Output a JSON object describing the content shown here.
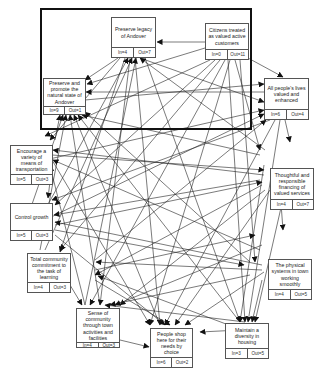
{
  "diagram": {
    "type": "interrelationship-digraph",
    "highlight_frame": "thick rectangle enclosing top drivers",
    "nodes": [
      {
        "id": "legacy",
        "label": "Preserve legacy of Andover",
        "in": "In=4",
        "out": "Out=7"
      },
      {
        "id": "citizens",
        "label": "Citizens treated as valued active customers",
        "in": "In=0",
        "out": "Out=11"
      },
      {
        "id": "natural",
        "label": "Preserve and promote the natural state of Andover",
        "in": "In=9",
        "out": "Out=1"
      },
      {
        "id": "people",
        "label": "All people's lives valued and enhanced",
        "in": "In=6",
        "out": "Out=4"
      },
      {
        "id": "transport",
        "label": "Encourage a variety of means of transportation",
        "in": "In=5",
        "out": "Out=3"
      },
      {
        "id": "financing",
        "label": "Thoughtful and responsible financing of valued services",
        "in": "In=4",
        "out": "Out=7"
      },
      {
        "id": "growth",
        "label": "Control growth",
        "in": "In=5",
        "out": "Out=3"
      },
      {
        "id": "learning",
        "label": "Total community commitment to the task of learning",
        "in": "In=4",
        "out": "Out=3"
      },
      {
        "id": "physical",
        "label": "The physical systems in town working smoothly",
        "in": "In=4",
        "out": "Out=5"
      },
      {
        "id": "community",
        "label": "Sense of community through town activities and facilities",
        "in": "In=4",
        "out": "Out=3"
      },
      {
        "id": "shop",
        "label": "People shop here for their needs by choice",
        "in": "In=6",
        "out": "Out=2"
      },
      {
        "id": "housing",
        "label": "Maintain a diversity in housing",
        "in": "In=3",
        "out": "Out=5"
      }
    ]
  }
}
